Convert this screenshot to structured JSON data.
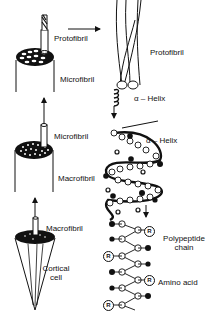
{
  "diagram": {
    "labels": {
      "protofibril_left": "Protofibril",
      "microfibril_top": "Microfibril",
      "microfibril_mid": "Microfibril",
      "macrofibril_mid": "Macrofibril",
      "macrofibril_bottom": "Macrofibril",
      "cortical_cell_line1": "Cortical",
      "cortical_cell_line2": "cell",
      "protofibril_right": "Protofibril",
      "alpha_helix_top": "α – Helix",
      "alpha_helix_mid": "α – Helix",
      "polypeptide_line1": "Polypeptide",
      "polypeptide_line2": "chain",
      "amino_acid": "Amino acid"
    },
    "side_chain_symbol": "R",
    "colors": {
      "ink": "#111111",
      "background": "#ffffff"
    }
  }
}
